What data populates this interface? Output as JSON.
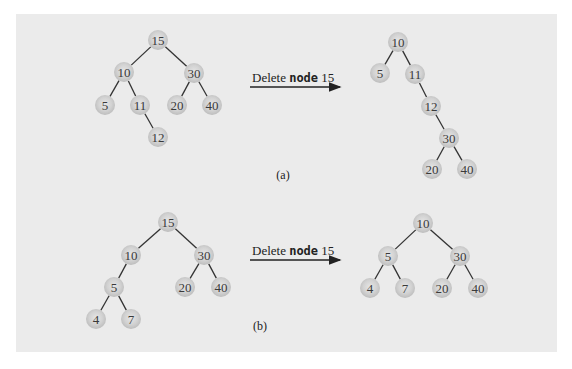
{
  "diagram": {
    "colors": {
      "panel_background": "#ebebeb",
      "node_fill": "#c6c6c6",
      "node_highlight": "#e6e6e6",
      "edge": "#333333",
      "text": "#222222"
    },
    "parts": [
      {
        "id": "a",
        "caption": "(a)",
        "operation": {
          "prefix": "Delete ",
          "keyword": "node",
          "suffix": " 15"
        },
        "before": {
          "nodes": [
            {
              "key": "15",
              "x": 158,
              "y": 40
            },
            {
              "key": "10",
              "x": 124,
              "y": 72
            },
            {
              "key": "30",
              "x": 194,
              "y": 73
            },
            {
              "key": "5",
              "x": 105,
              "y": 105
            },
            {
              "key": "11",
              "x": 140,
              "y": 105
            },
            {
              "key": "20",
              "x": 177,
              "y": 105
            },
            {
              "key": "40",
              "x": 212,
              "y": 105
            },
            {
              "key": "12",
              "x": 158,
              "y": 137
            }
          ],
          "edges": [
            [
              "15",
              "10"
            ],
            [
              "15",
              "30"
            ],
            [
              "10",
              "5"
            ],
            [
              "10",
              "11"
            ],
            [
              "11",
              "12"
            ],
            [
              "30",
              "20"
            ],
            [
              "30",
              "40"
            ]
          ]
        },
        "after": {
          "nodes": [
            {
              "key": "10",
              "x": 398,
              "y": 42
            },
            {
              "key": "5",
              "x": 380,
              "y": 73
            },
            {
              "key": "11",
              "x": 415,
              "y": 74
            },
            {
              "key": "12",
              "x": 431,
              "y": 106
            },
            {
              "key": "30",
              "x": 449,
              "y": 138
            },
            {
              "key": "20",
              "x": 432,
              "y": 169
            },
            {
              "key": "40",
              "x": 467,
              "y": 169
            }
          ],
          "edges": [
            [
              "10",
              "5"
            ],
            [
              "10",
              "11"
            ],
            [
              "11",
              "12"
            ],
            [
              "12",
              "30"
            ],
            [
              "30",
              "20"
            ],
            [
              "30",
              "40"
            ]
          ]
        }
      },
      {
        "id": "b",
        "caption": "(b)",
        "operation": {
          "prefix": "Delete ",
          "keyword": "node",
          "suffix": " 15"
        },
        "before": {
          "nodes": [
            {
              "key": "15",
              "x": 168,
              "y": 222
            },
            {
              "key": "10",
              "x": 131,
              "y": 255
            },
            {
              "key": "30",
              "x": 204,
              "y": 255
            },
            {
              "key": "5",
              "x": 114,
              "y": 287
            },
            {
              "key": "20",
              "x": 185,
              "y": 287
            },
            {
              "key": "40",
              "x": 221,
              "y": 287
            },
            {
              "key": "4",
              "x": 96,
              "y": 319
            },
            {
              "key": "7",
              "x": 131,
              "y": 319
            }
          ],
          "edges": [
            [
              "15",
              "10"
            ],
            [
              "15",
              "30"
            ],
            [
              "10",
              "5"
            ],
            [
              "5",
              "4"
            ],
            [
              "5",
              "7"
            ],
            [
              "30",
              "20"
            ],
            [
              "30",
              "40"
            ]
          ]
        },
        "after": {
          "nodes": [
            {
              "key": "10",
              "x": 423,
              "y": 223
            },
            {
              "key": "5",
              "x": 388,
              "y": 256
            },
            {
              "key": "30",
              "x": 460,
              "y": 256
            },
            {
              "key": "4",
              "x": 370,
              "y": 288
            },
            {
              "key": "7",
              "x": 405,
              "y": 288
            },
            {
              "key": "20",
              "x": 442,
              "y": 288
            },
            {
              "key": "40",
              "x": 478,
              "y": 288
            }
          ],
          "edges": [
            [
              "10",
              "5"
            ],
            [
              "10",
              "30"
            ],
            [
              "5",
              "4"
            ],
            [
              "5",
              "7"
            ],
            [
              "30",
              "20"
            ],
            [
              "30",
              "40"
            ]
          ]
        }
      }
    ]
  }
}
